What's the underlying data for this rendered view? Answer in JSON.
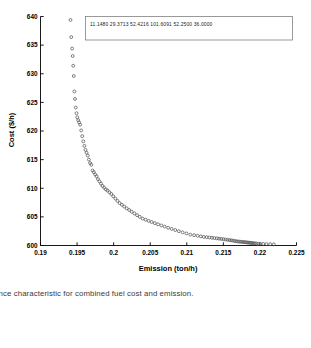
{
  "figure": {
    "caption": "rgence characteristic for combined fuel cost and emission.",
    "background": "#ffffff",
    "axis_color": "#000000",
    "marker_color": "#555555"
  },
  "legend": {
    "box_border": "#808080",
    "values": [
      "11.1480",
      "29.3713",
      "52.4216",
      "101.6091",
      "52.2500",
      "36.0000"
    ],
    "text": "11.1480  29.3713  52.4216  101.6091  52.2500  36.0000"
  },
  "chart_data": {
    "type": "scatter",
    "title": "",
    "xlabel": "Emission (ton/h)",
    "ylabel": "Cost ($/h)",
    "xlim": [
      0.19,
      0.225
    ],
    "ylim": [
      600,
      640
    ],
    "xticks": [
      0.19,
      0.195,
      0.2,
      0.205,
      0.21,
      0.215,
      0.22,
      0.225
    ],
    "xticklabels": [
      "0.19",
      "0.195",
      "0.2",
      "0.205",
      "0.21",
      "0.215",
      "0.22",
      "0.225"
    ],
    "yticks": [
      600,
      605,
      610,
      615,
      620,
      625,
      630,
      635,
      640
    ],
    "yticklabels": [
      "600",
      "605",
      "610",
      "615",
      "620",
      "625",
      "630",
      "635",
      "640"
    ],
    "grid": false,
    "legend_position": "top-center",
    "marker": "open-circle",
    "series": [
      {
        "name": "Pareto front",
        "x": [
          0.1941,
          0.1942,
          0.19432,
          0.1944,
          0.19448,
          0.19455,
          0.19463,
          0.19472,
          0.19482,
          0.19492,
          0.19503,
          0.19515,
          0.19528,
          0.19542,
          0.19556,
          0.1957,
          0.19585,
          0.196,
          0.19615,
          0.1963,
          0.19646,
          0.19662,
          0.19678,
          0.19695,
          0.19712,
          0.1973,
          0.19748,
          0.19767,
          0.19786,
          0.19806,
          0.19827,
          0.19848,
          0.1987,
          0.19893,
          0.19917,
          0.19942,
          0.19968,
          0.19995,
          0.20023,
          0.20052,
          0.20082,
          0.20113,
          0.20145,
          0.20178,
          0.20212,
          0.20247,
          0.20283,
          0.2032,
          0.20358,
          0.20397,
          0.20437,
          0.20478,
          0.2052,
          0.20563,
          0.20607,
          0.20652,
          0.20698,
          0.20745,
          0.20793,
          0.20842,
          0.20892,
          0.20943,
          0.20995,
          0.21048,
          0.211,
          0.21148,
          0.21192,
          0.21233,
          0.21272,
          0.21309,
          0.21344,
          0.21378,
          0.2141,
          0.21441,
          0.21471,
          0.215,
          0.21528,
          0.21555,
          0.21581,
          0.21606,
          0.2163,
          0.21653,
          0.21675,
          0.21697,
          0.21718,
          0.21738,
          0.21758,
          0.21777,
          0.21795,
          0.21813,
          0.2183,
          0.21847,
          0.21863,
          0.21879,
          0.21895,
          0.21912,
          0.2193,
          0.2195,
          0.21975,
          0.22005,
          0.22045,
          0.2209,
          0.2214,
          0.2219
        ],
        "y": [
          639.4,
          636.4,
          634.4,
          633.1,
          631.4,
          629.6,
          626.9,
          625.6,
          624.1,
          623.1,
          622.4,
          621.9,
          621.5,
          621.1,
          620.1,
          619.1,
          618.2,
          617.4,
          616.7,
          616.2,
          615.7,
          615.0,
          614.4,
          614.1,
          613.1,
          612.8,
          612.4,
          612.1,
          611.6,
          611.2,
          610.8,
          610.4,
          610.1,
          609.8,
          609.6,
          609.3,
          609.0,
          608.6,
          608.2,
          607.8,
          607.4,
          607.1,
          606.8,
          606.5,
          606.2,
          605.9,
          605.6,
          605.3,
          605.0,
          604.7,
          604.5,
          604.3,
          604.1,
          603.9,
          603.7,
          603.5,
          603.3,
          603.1,
          602.9,
          602.7,
          602.5,
          602.3,
          602.1,
          601.9,
          601.8,
          601.7,
          601.6,
          601.5,
          601.45,
          601.4,
          601.35,
          601.3,
          601.25,
          601.2,
          601.15,
          601.1,
          601.05,
          601.0,
          600.95,
          600.9,
          600.85,
          600.8,
          600.75,
          600.7,
          600.68,
          600.65,
          600.62,
          600.6,
          600.58,
          600.55,
          600.52,
          600.5,
          600.48,
          600.45,
          600.42,
          600.4,
          600.38,
          600.35,
          600.32,
          600.3,
          600.28,
          600.25,
          600.22,
          600.2
        ]
      }
    ]
  }
}
